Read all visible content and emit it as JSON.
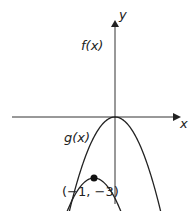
{
  "figure": {
    "x_axis_label": "x",
    "y_axis_label": "y",
    "curves": [
      {
        "name": "f",
        "label": "f(x)",
        "vertex": "(0, 0)"
      },
      {
        "name": "g",
        "label": "g(x)",
        "vertex": "(−1, −3)"
      }
    ],
    "point_label": "(−1, −3)",
    "stroke_color": "#222222"
  }
}
